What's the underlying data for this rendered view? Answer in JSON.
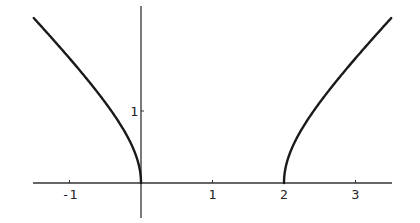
{
  "chart_data": {
    "type": "line",
    "title": "",
    "xlabel": "",
    "ylabel": "",
    "xlim": [
      -1.52,
      3.52
    ],
    "ylim": [
      -0.48,
      2.48
    ],
    "grid": false,
    "legend": null,
    "x_ticks": [
      {
        "value": -1,
        "label": "-1"
      },
      {
        "value": 1,
        "label": "1"
      },
      {
        "value": 2,
        "label": "2"
      },
      {
        "value": 3,
        "label": "3"
      }
    ],
    "y_ticks": [
      {
        "value": 1,
        "label": "1"
      }
    ],
    "series": [
      {
        "name": "left-branch",
        "function": "y = sqrt(x(x-2)), x <= 0",
        "x": [
          -1.5,
          -1.25,
          -1.0,
          -0.75,
          -0.5,
          -0.3,
          -0.15,
          -0.07,
          -0.02,
          0.0
        ],
        "y": [
          2.29,
          2.02,
          1.73,
          1.44,
          1.12,
          0.83,
          0.59,
          0.4,
          0.2,
          0.0
        ]
      },
      {
        "name": "right-branch",
        "function": "y = sqrt(x(x-2)), x >= 2",
        "x": [
          2.0,
          2.02,
          2.07,
          2.15,
          2.3,
          2.5,
          2.75,
          3.0,
          3.25,
          3.5
        ],
        "y": [
          0.0,
          0.2,
          0.4,
          0.59,
          0.83,
          1.12,
          1.44,
          1.73,
          2.02,
          2.29
        ]
      }
    ]
  },
  "plot_px": {
    "origin_x": 141,
    "origin_y": 183,
    "unit_x": 71.5,
    "unit_y": 72,
    "x_axis": {
      "x1": 33,
      "x2": 392
    },
    "y_axis": {
      "y1": 6,
      "y2": 218
    }
  }
}
